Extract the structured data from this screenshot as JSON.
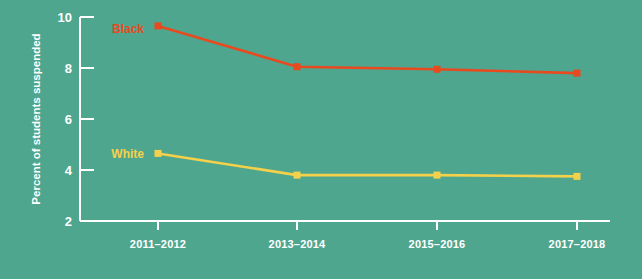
{
  "background_color": "#4fa68f",
  "axis_color": "#ffffff",
  "chart_data": {
    "type": "line",
    "title": "",
    "subtitle": "",
    "xlabel": "",
    "ylabel": "Percent of students suspended",
    "categories": [
      "2011–2012",
      "2013–2014",
      "2015–2016",
      "2017–2018"
    ],
    "ylim": [
      2,
      10
    ],
    "yticks": [
      2,
      4,
      6,
      8,
      10
    ],
    "ytick_labels": [
      "2",
      "4",
      "6",
      "8",
      "10"
    ],
    "grid": false,
    "legend_position": "inline-left",
    "series": [
      {
        "name": "Black",
        "color": "#e8491f",
        "marker": "square",
        "label_x": 9,
        "label_y": 33,
        "values": [
          9.65,
          8.05,
          7.95,
          7.8
        ]
      },
      {
        "name": "White",
        "color": "#f4d14a",
        "marker": "square",
        "label_x": 9,
        "label_y": 158,
        "values": [
          4.65,
          3.8,
          3.8,
          3.75
        ]
      }
    ]
  },
  "geometry": {
    "plot_left": 80,
    "plot_right": 610,
    "plot_top": 17,
    "plot_bottom": 221,
    "tick_len": 14,
    "x_positions": [
      158,
      297,
      437,
      577
    ],
    "marker_size": 7
  }
}
